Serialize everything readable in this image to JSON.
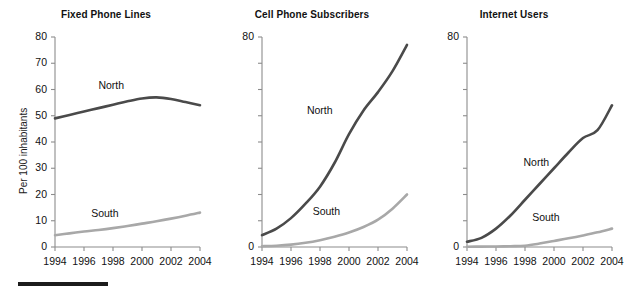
{
  "figure": {
    "axis_color": "#8c8c8c",
    "north_color": "#4a4a4a",
    "south_color": "#a8a8a8",
    "rule_color": "#1c1c1c",
    "ylabel": "Per 100 inhabitants"
  },
  "chart_data": [
    {
      "type": "line",
      "title": "Fixed Phone Lines",
      "xlabel": "",
      "ylabel": "Per 100 inhabitants",
      "x": [
        1994,
        1995,
        1996,
        1997,
        1998,
        1999,
        2000,
        2001,
        2002,
        2003,
        2004
      ],
      "xticks": [
        "1994",
        "1996",
        "1998",
        "2000",
        "2002",
        "2004"
      ],
      "xtick_values": [
        1994,
        1996,
        1998,
        2000,
        2002,
        2004
      ],
      "yticks": [
        "0",
        "10",
        "20",
        "30",
        "40",
        "50",
        "60",
        "70",
        "80"
      ],
      "ytick_values": [
        0,
        10,
        20,
        30,
        40,
        50,
        60,
        70,
        80
      ],
      "ylim": [
        0,
        80
      ],
      "xlim": [
        1994,
        2004
      ],
      "grid": false,
      "legend": "inline-labels",
      "series": [
        {
          "name": "North",
          "color": "#4a4a4a",
          "label_x": 1998.1,
          "label_y": 61.5,
          "values": [
            49.0,
            50.3,
            51.6,
            52.9,
            54.2,
            55.5,
            56.6,
            57.0,
            56.4,
            55.2,
            54.0
          ]
        },
        {
          "name": "South",
          "color": "#a8a8a8",
          "label_x": 1997.6,
          "label_y": 12.6,
          "values": [
            4.5,
            5.2,
            5.9,
            6.5,
            7.2,
            8.0,
            8.9,
            9.8,
            10.8,
            11.9,
            13.1
          ]
        }
      ]
    },
    {
      "type": "line",
      "title": "Cell Phone Subscribers",
      "xlabel": "",
      "ylabel": "",
      "x": [
        1994,
        1995,
        1996,
        1997,
        1998,
        1999,
        2000,
        2001,
        2002,
        2003,
        2004
      ],
      "xticks": [
        "1994",
        "1996",
        "1998",
        "2000",
        "2002",
        "2004"
      ],
      "xtick_values": [
        1994,
        1996,
        1998,
        2000,
        2002,
        2004
      ],
      "yticks": [
        "0",
        "",
        "",
        "",
        "",
        "",
        "",
        "",
        "80"
      ],
      "ytick_values": [
        0,
        10,
        20,
        30,
        40,
        50,
        60,
        70,
        80
      ],
      "ylim": [
        0,
        80
      ],
      "xlim": [
        1994,
        2004
      ],
      "grid": false,
      "legend": "inline-labels",
      "series": [
        {
          "name": "North",
          "color": "#4a4a4a",
          "label_x": 1998.2,
          "label_y": 52.0,
          "values": [
            4.5,
            7.0,
            11.0,
            16.5,
            23.0,
            32.0,
            43.0,
            52.0,
            59.0,
            67.0,
            77.0
          ]
        },
        {
          "name": "South",
          "color": "#a8a8a8",
          "label_x": 1998.6,
          "label_y": 13.5,
          "values": [
            0.3,
            0.5,
            0.9,
            1.6,
            2.6,
            3.9,
            5.5,
            7.6,
            10.4,
            14.6,
            20.0
          ]
        }
      ]
    },
    {
      "type": "line",
      "title": "Internet Users",
      "xlabel": "",
      "ylabel": "",
      "x": [
        1994,
        1995,
        1996,
        1997,
        1998,
        1999,
        2000,
        2001,
        2002,
        2003,
        2004
      ],
      "xticks": [
        "1994",
        "1996",
        "1998",
        "2000",
        "2002",
        "2004"
      ],
      "xtick_values": [
        1994,
        1996,
        1998,
        2000,
        2002,
        2004
      ],
      "yticks": [
        "0",
        "",
        "",
        "",
        "",
        "",
        "",
        "",
        "80"
      ],
      "ytick_values": [
        0,
        10,
        20,
        30,
        40,
        50,
        60,
        70,
        80
      ],
      "ylim": [
        0,
        80
      ],
      "xlim": [
        1994,
        2004
      ],
      "grid": false,
      "legend": "inline-labels",
      "series": [
        {
          "name": "North",
          "color": "#4a4a4a",
          "label_x": 1999.0,
          "label_y": 32.0,
          "values": [
            2.0,
            3.5,
            7.0,
            12.0,
            18.0,
            24.0,
            30.0,
            36.0,
            41.5,
            44.5,
            54.0
          ]
        },
        {
          "name": "South",
          "color": "#a8a8a8",
          "label_x": 1999.6,
          "label_y": 11.0,
          "values": [
            0.1,
            0.15,
            0.2,
            0.3,
            0.5,
            1.3,
            2.3,
            3.3,
            4.4,
            5.6,
            7.0
          ]
        }
      ]
    }
  ]
}
